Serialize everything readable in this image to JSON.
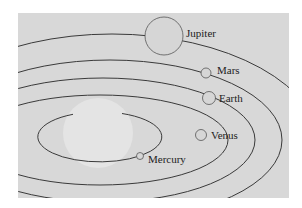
{
  "diagram": {
    "type": "solar-system-orbits",
    "colors": {
      "page_background": "#ffffff",
      "panel_background": "#d8d8d8",
      "sun_fill": "#e6e6e6",
      "orbit_stroke": "#3a3a3a",
      "planet_fill": "#d4d4d4",
      "planet_stroke": "#555555",
      "label_color": "#222222"
    },
    "sun": {
      "label": ""
    },
    "planets": [
      {
        "name": "Mercury",
        "label": "Mercury"
      },
      {
        "name": "Venus",
        "label": "Venus"
      },
      {
        "name": "Earth",
        "label": "Earth"
      },
      {
        "name": "Mars",
        "label": "Mars"
      },
      {
        "name": "Jupiter",
        "label": "Jupiter"
      }
    ]
  }
}
